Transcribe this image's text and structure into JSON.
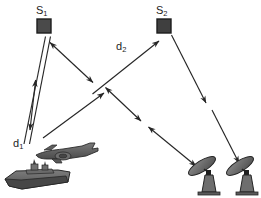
{
  "figure": {
    "background_color": "#ffffff",
    "stroke_color": "#262626",
    "node_fill_color": "#4a4a4a",
    "platform_fill_color": "#6a6a6a",
    "width": 261,
    "height": 198
  },
  "labels": {
    "s1": "S",
    "s1_sub": "1",
    "s2": "S",
    "s2_sub": "2",
    "d1": "d",
    "d1_sub": "1",
    "d2": "d",
    "d2_sub": "2"
  },
  "nodes": [
    {
      "name": "satellite-s1",
      "label": "S1",
      "x": 37,
      "y": 19,
      "w": 14,
      "h": 14
    },
    {
      "name": "satellite-s2",
      "label": "S2",
      "x": 157,
      "y": 19,
      "w": 14,
      "h": 14
    }
  ],
  "platforms": [
    {
      "name": "aircraft",
      "x": 35,
      "y": 143,
      "w": 64,
      "h": 21
    },
    {
      "name": "ship",
      "x": 4,
      "y": 166,
      "w": 68,
      "h": 24
    },
    {
      "name": "radar-dish-left",
      "x": 188,
      "y": 152,
      "w": 33,
      "h": 44
    },
    {
      "name": "radar-dish-right",
      "x": 226,
      "y": 152,
      "w": 33,
      "h": 44
    }
  ],
  "links": [
    {
      "name": "link-s1-ship-outbound",
      "from": "satellite-s1",
      "to": "ship",
      "arrow": "none"
    },
    {
      "name": "link-s1-ship-return",
      "from": "ship",
      "to": "satellite-s1",
      "arrow": "none"
    },
    {
      "name": "link-d1-bidirectional",
      "from": "satellite-s1",
      "to": "ship",
      "arrow": "both",
      "label": "d1"
    },
    {
      "name": "link-s1-to-crossing-bidirectional",
      "from": "satellite-s1",
      "to": "crossing-point",
      "arrow": "both"
    },
    {
      "name": "link-aircraft-to-crossing",
      "from": "aircraft",
      "to": "crossing-point",
      "arrow": "end"
    },
    {
      "name": "link-crossing-to-s2",
      "from": "crossing-point",
      "to": "satellite-s2",
      "arrow": "end",
      "label": "d2"
    },
    {
      "name": "link-crossing-to-dish-left-upper",
      "from": "crossing-point",
      "to": "radar-dish-left",
      "arrow": "both"
    },
    {
      "name": "link-crossing-to-dish-left-lower",
      "from": "crossing-point",
      "to": "radar-dish-left",
      "arrow": "both"
    },
    {
      "name": "link-s2-to-dish-right",
      "from": "satellite-s2",
      "to": "radar-dish-right",
      "arrow": "end"
    }
  ]
}
